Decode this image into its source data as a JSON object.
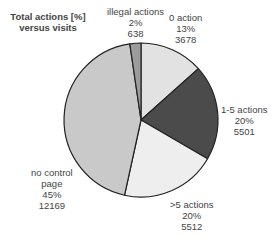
{
  "chart_data": {
    "type": "pie",
    "title": "Total actions [%] versus visits",
    "categories": [
      "0 action",
      "1-5 actions",
      ">5 actions",
      "no control page",
      "illegal actions"
    ],
    "percent": [
      13,
      20,
      20,
      45,
      2
    ],
    "values": [
      3678,
      5501,
      5512,
      12169,
      638
    ],
    "colors": [
      "#e2e2e2",
      "#4b4b4b",
      "#eeeeee",
      "#c9c9c9",
      "#9c9c9c"
    ],
    "legend": "none (inline slice labels)"
  },
  "labels": {
    "title_line1": "Total actions [%]",
    "title_line2": "versus visits",
    "illegal": {
      "name": "illegal actions",
      "pct": "2%",
      "count": "638"
    },
    "zero": {
      "name": "0 action",
      "pct": "13%",
      "count": "3678"
    },
    "onefive": {
      "name": "1-5 actions",
      "pct": "20%",
      "count": "5501"
    },
    "gtfive": {
      "name": ">5 actions",
      "pct": "20%",
      "count": "5512"
    },
    "nocontrol": {
      "name1": "no control",
      "name2": "page",
      "pct": "45%",
      "count": "12169"
    }
  }
}
